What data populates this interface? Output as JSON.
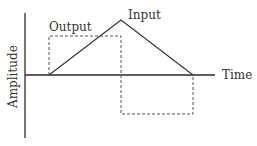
{
  "diagram": {
    "type": "signal-waveform",
    "labels": {
      "y_axis": "Amplitude",
      "x_axis": "Time",
      "input": "Input",
      "output": "Output"
    },
    "colors": {
      "axis": "#2a2a2a",
      "input_line": "#333333",
      "output_dashed": "#555555",
      "text": "#333333"
    },
    "input_signal": {
      "shape": "triangle",
      "points": [
        [
          49,
          75
        ],
        [
          121,
          20
        ],
        [
          193,
          75
        ]
      ]
    },
    "output_signal": {
      "shape": "square-pulse (dashed)",
      "points": [
        [
          49,
          75
        ],
        [
          49,
          36
        ],
        [
          121,
          36
        ],
        [
          121,
          114
        ],
        [
          193,
          114
        ],
        [
          193,
          75
        ]
      ]
    }
  }
}
